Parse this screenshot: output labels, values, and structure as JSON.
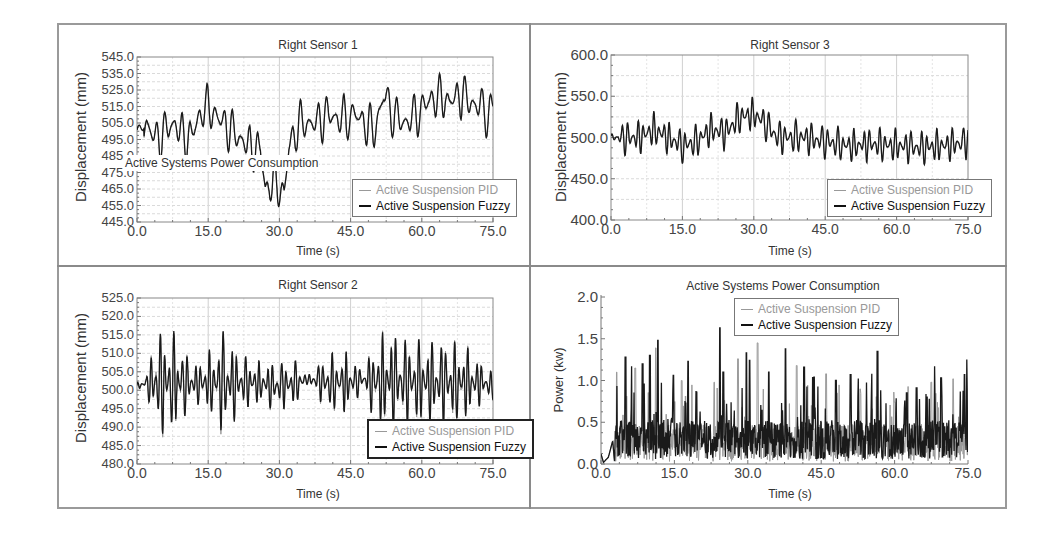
{
  "figure": {
    "frame_color": "#9a9a9a",
    "series_colors": {
      "pid": "#9a9a9a",
      "fuzzy": "#1a1a1a"
    },
    "legend": {
      "pid_label": "Active Suspension PID",
      "fuzzy_label": "Active Suspension Fuzzy"
    }
  },
  "overlay_text": "Active Systems Power Consumption",
  "chart_data": [
    {
      "id": "right-sensor-1",
      "type": "line",
      "title": "Right Sensor 1",
      "xlabel": "Time (s)",
      "ylabel": "Displacement (mm)",
      "xlim": [
        0,
        75
      ],
      "ylim": [
        445,
        545
      ],
      "x_ticks": [
        "0.0",
        "15.0",
        "30.0",
        "45.0",
        "60.0",
        "75.0"
      ],
      "y_ticks": [
        "545.0",
        "535.0",
        "525.0",
        "515.0",
        "505.0",
        "495.0",
        "485.0",
        "475.0",
        "465.0",
        "455.0",
        "445.0"
      ],
      "grid": true,
      "legend_position": "lower right",
      "series": [
        {
          "name": "Active Suspension PID"
        },
        {
          "name": "Active Suspension Fuzzy"
        }
      ],
      "envelope": {
        "x": [
          0,
          2,
          4,
          6,
          8,
          10,
          12,
          14,
          16,
          18,
          20,
          22,
          24,
          26,
          27,
          29,
          31,
          32,
          34,
          36,
          38,
          40,
          42,
          44,
          46,
          48,
          50,
          52,
          54,
          56,
          58,
          60,
          62,
          64,
          66,
          68,
          70,
          72,
          74,
          75
        ],
        "y": [
          500,
          504,
          495,
          500,
          505,
          495,
          500,
          515,
          512,
          505,
          500,
          495,
          490,
          490,
          465,
          470,
          462,
          490,
          505,
          505,
          505,
          510,
          508,
          508,
          510,
          505,
          500,
          522,
          510,
          505,
          508,
          513,
          520,
          520,
          518,
          522,
          518,
          515,
          510,
          515
        ],
        "amplitude": 15,
        "freq": 0.55
      },
      "annotations": [
        "peak ~540 at t≈68s",
        "dip ~448 at t≈27s and t≈31s"
      ]
    },
    {
      "id": "right-sensor-3",
      "type": "line",
      "title": "Right Sensor  3",
      "xlabel": "Time (s)",
      "ylabel": "Displacement (mm)",
      "xlim": [
        0,
        75
      ],
      "ylim": [
        400,
        600
      ],
      "x_ticks": [
        "0.0",
        "15.0",
        "30.0",
        "45.0",
        "60.0",
        "75.0"
      ],
      "y_ticks": [
        "600.0",
        "550.0",
        "500.0",
        "450.0",
        "400.0"
      ],
      "grid": true,
      "legend_position": "lower right",
      "series": [
        {
          "name": "Active Suspension PID"
        },
        {
          "name": "Active Suspension Fuzzy"
        }
      ],
      "envelope": {
        "x": [
          0,
          3,
          6,
          9,
          12,
          15,
          18,
          21,
          24,
          27,
          30,
          32,
          35,
          40,
          45,
          50,
          55,
          60,
          65,
          70,
          75
        ],
        "y": [
          500,
          500,
          500,
          510,
          500,
          490,
          495,
          510,
          505,
          525,
          528,
          520,
          500,
          500,
          495,
          490,
          492,
          490,
          488,
          490,
          495
        ],
        "amplitude": 22,
        "freq": 0.9
      },
      "annotations": [
        "peak ~550 at t≈27s and t≈30s",
        "trough ~455 at t≈68s"
      ]
    },
    {
      "id": "right-sensor-2",
      "type": "line",
      "title": "Right Sensor 2",
      "xlabel": "Time (s)",
      "ylabel": "Displacement (mm)",
      "xlim": [
        0,
        75
      ],
      "ylim": [
        480,
        525
      ],
      "x_ticks": [
        "0.0",
        "15.0",
        "30.0",
        "45.0",
        "60.0",
        "75.0"
      ],
      "y_ticks": [
        "525.0",
        "520.0",
        "515.0",
        "510.0",
        "505.0",
        "500.0",
        "495.0",
        "490.0",
        "485.0",
        "480.0"
      ],
      "grid": true,
      "legend_position": "lower right",
      "series": [
        {
          "name": "Active Suspension PID"
        },
        {
          "name": "Active Suspension Fuzzy"
        }
      ],
      "envelope": {
        "x": [
          0,
          2,
          4,
          8,
          12,
          16,
          18,
          22,
          26,
          30,
          34,
          36,
          40,
          44,
          48,
          50,
          54,
          58,
          62,
          66,
          70,
          73,
          75
        ],
        "y": [
          501,
          502,
          502,
          502,
          502,
          502,
          502,
          502,
          502,
          501,
          502,
          503,
          502,
          502,
          503,
          502,
          503,
          502,
          502,
          502,
          502,
          502,
          501
        ],
        "amp_envelope": [
          1,
          2,
          15,
          14,
          5,
          10,
          15,
          8,
          6,
          7,
          6,
          1,
          8,
          9,
          2,
          13,
          14,
          12,
          12,
          12,
          10,
          5,
          4
        ],
        "freq": 1.05
      },
      "annotations": [
        "max ~521 at t≈54s",
        "min ~483 at t≈17s"
      ]
    },
    {
      "id": "power-consumption",
      "type": "line",
      "title": "Active Systems Power Consumption",
      "xlabel": "Time (s)",
      "ylabel": "Power (kw)",
      "xlim": [
        0,
        75
      ],
      "ylim": [
        0,
        2
      ],
      "x_ticks": [
        "0.0",
        "15.0",
        "30.0",
        "45.0",
        "60.0",
        "75.0"
      ],
      "y_ticks": [
        "2.0",
        "1.5",
        "1.0",
        "0.5",
        "0.0"
      ],
      "grid": false,
      "legend_position": "upper center",
      "series": [
        {
          "name": "Active Suspension PID"
        },
        {
          "name": "Active Suspension Fuzzy"
        }
      ],
      "envelope": {
        "base_mean": 0.3,
        "spike_peaks": [
          [
            3.2,
            1.1
          ],
          [
            5.0,
            1.28
          ],
          [
            6.2,
            1.17
          ],
          [
            7.0,
            1.15
          ],
          [
            8.5,
            1.2
          ],
          [
            10.0,
            1.3
          ],
          [
            11.2,
            1.39
          ],
          [
            11.6,
            1.48
          ],
          [
            14.8,
            1.06
          ],
          [
            16.5,
            1.0
          ],
          [
            17.8,
            1.23
          ],
          [
            19.5,
            0.86
          ],
          [
            23.1,
            0.98
          ],
          [
            24.3,
            1.63
          ],
          [
            25.0,
            1.1
          ],
          [
            28.0,
            1.26
          ],
          [
            29.7,
            1.33
          ],
          [
            30.4,
            1.24
          ],
          [
            32.0,
            1.45
          ],
          [
            34.3,
            1.1
          ],
          [
            37.7,
            1.38
          ],
          [
            40.0,
            1.18
          ],
          [
            41.5,
            1.16
          ],
          [
            43.5,
            1.04
          ],
          [
            46.0,
            1.08
          ],
          [
            48.0,
            1.0
          ],
          [
            51.0,
            1.07
          ],
          [
            53.0,
            0.9
          ],
          [
            55.3,
            1.08
          ],
          [
            56.5,
            1.35
          ],
          [
            60.0,
            0.74
          ],
          [
            62.5,
            0.85
          ],
          [
            64.5,
            0.91
          ],
          [
            67.5,
            0.98
          ],
          [
            68.2,
            1.17
          ],
          [
            69.5,
            1.03
          ],
          [
            72.0,
            1.02
          ],
          [
            74.3,
            1.07
          ],
          [
            74.8,
            1.25
          ]
        ],
        "startup": [
          [
            0,
            0.12
          ],
          [
            0.5,
            0.02
          ],
          [
            1.5,
            0.08
          ],
          [
            2.4,
            0.28
          ],
          [
            2.8,
            0.0
          ]
        ]
      },
      "annotations": [
        "max spike ~1.63 kW at t≈24s (PID)"
      ]
    }
  ]
}
